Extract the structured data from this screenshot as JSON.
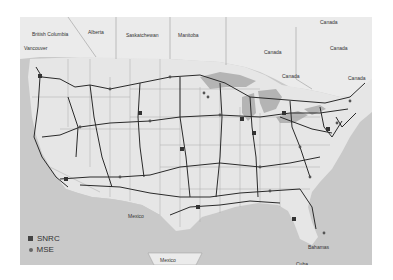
{
  "map": {
    "labels": {
      "british_columbia": "British Columbia",
      "alberta": "Alberta",
      "saskatchewan": "Saskatchewan",
      "manitoba": "Manitoba",
      "canada_top": "Canada",
      "canada_ne": "Canada",
      "canada_lakes": "Canada",
      "canada_ontario": "Canada",
      "canada_east": "Canada",
      "vancouver": "Vancouver",
      "mexico_gulf": "Mexico",
      "mexico_box": "Mexico",
      "bahamas": "Bahamas",
      "cuba": "Cuba"
    },
    "colors": {
      "land": "#e6e6e6",
      "water": "#c9c9c9",
      "lakes": "#b4b4b4",
      "borders": "#9a9a9a",
      "routes": "#2a2a2a"
    }
  },
  "legend": {
    "items": [
      {
        "symbol": "square",
        "label": "SNRC"
      },
      {
        "symbol": "circle",
        "label": "MSE"
      }
    ]
  }
}
